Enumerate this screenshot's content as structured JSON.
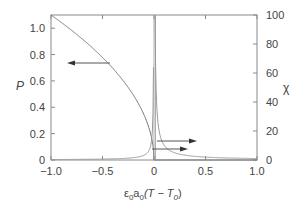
{
  "chart_data": {
    "type": "line",
    "title": "",
    "xlabel": "ε0a0(T − T0)",
    "ylabel_left": "P",
    "ylabel_right": "χ",
    "xlim": [
      -1.0,
      1.0
    ],
    "ylim_left": [
      0,
      1.1
    ],
    "ylim_right": [
      0,
      100
    ],
    "x_ticks": [
      "−1.0",
      "−0.5",
      "0",
      "0.5",
      "1.0"
    ],
    "y_left_ticks": [
      "0",
      "0.2",
      "0.4",
      "0.6",
      "0.8",
      "1.0"
    ],
    "y_right_ticks": [
      "0",
      "20",
      "40",
      "60",
      "80",
      "100"
    ],
    "grid": false,
    "series": [
      {
        "name": "P (order parameter)",
        "axis": "left",
        "x": [
          -1.0,
          -0.8,
          -0.6,
          -0.4,
          -0.2,
          -0.1,
          -0.05,
          -0.01,
          0.0,
          0.5,
          1.0
        ],
        "values": [
          1.1,
          0.98,
          0.86,
          0.72,
          0.52,
          0.38,
          0.28,
          0.14,
          0.0,
          0.0,
          0.0
        ],
        "annotation": "arrow pointing left"
      },
      {
        "name": "χ (susceptibility), T<T0 branch",
        "axis": "right",
        "x": [
          -1.0,
          -0.5,
          -0.2,
          -0.1,
          -0.05,
          -0.02,
          -0.01
        ],
        "values": [
          0.3,
          0.6,
          1.6,
          3.2,
          6.5,
          16,
          32
        ],
        "annotation": "arrow pointing right (lower)"
      },
      {
        "name": "χ (susceptibility), T>T0 branch",
        "axis": "right",
        "x": [
          0.01,
          0.02,
          0.05,
          0.1,
          0.2,
          0.5,
          1.0
        ],
        "values": [
          100,
          50,
          20,
          10,
          5,
          2,
          1
        ],
        "annotation": "arrow pointing right (upper)"
      }
    ]
  },
  "labels": {
    "ylabel_left": "P",
    "ylabel_right": "χ",
    "xlabel_prefix": "ε",
    "xlabel_sub0": "0",
    "xlabel_a": "a",
    "xlabel_sub1": "0",
    "xlabel_mid": "(T − T",
    "xlabel_sub2": "0",
    "xlabel_end": ")"
  },
  "colors": {
    "axis": "#888888",
    "curve": "#777777",
    "text": "#444444"
  }
}
